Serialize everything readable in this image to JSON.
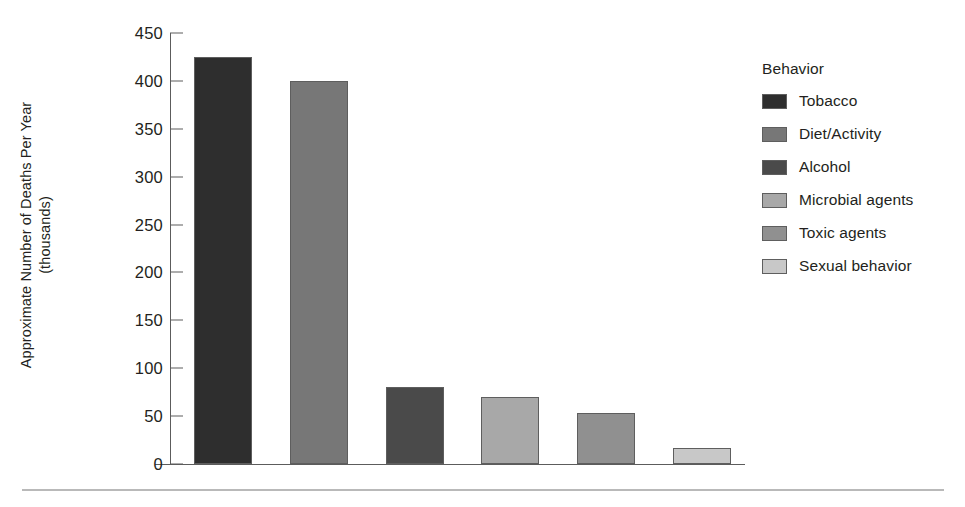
{
  "chart_data": {
    "type": "bar",
    "title": "",
    "xlabel": "",
    "ylabel_lines": [
      "Approximate Number of Deaths Per Year",
      "(thousands)"
    ],
    "ylabel": "Approximate Number of Deaths Per Year (thousands)",
    "categories": [
      "Tobacco",
      "Diet/Activity",
      "Alcohol",
      "Microbial agents",
      "Toxic agents",
      "Sexual behavior"
    ],
    "values": [
      425,
      400,
      80,
      70,
      53,
      17
    ],
    "colors": [
      "#2e2e2e",
      "#777777",
      "#4a4a4a",
      "#a8a8a8",
      "#909090",
      "#c8c8c8"
    ],
    "ylim": [
      0,
      450
    ],
    "ytick_values": [
      450,
      400,
      350,
      300,
      250,
      200,
      150,
      100,
      50,
      0
    ],
    "ytick_labels": [
      "450",
      "400",
      "350",
      "300",
      "250",
      "200",
      "150",
      "100",
      "50",
      "0"
    ],
    "xtick_labels": [],
    "grid": false,
    "legend_position": "right",
    "legend_title": "Behavior",
    "legend_entries": [
      {
        "label": "Tobacco",
        "color": "#2e2e2e"
      },
      {
        "label": "Diet/Activity",
        "color": "#777777"
      },
      {
        "label": "Alcohol",
        "color": "#4a4a4a"
      },
      {
        "label": "Microbial agents",
        "color": "#a8a8a8"
      },
      {
        "label": "Toxic agents",
        "color": "#909090"
      },
      {
        "label": "Sexual behavior",
        "color": "#c8c8c8"
      }
    ]
  }
}
